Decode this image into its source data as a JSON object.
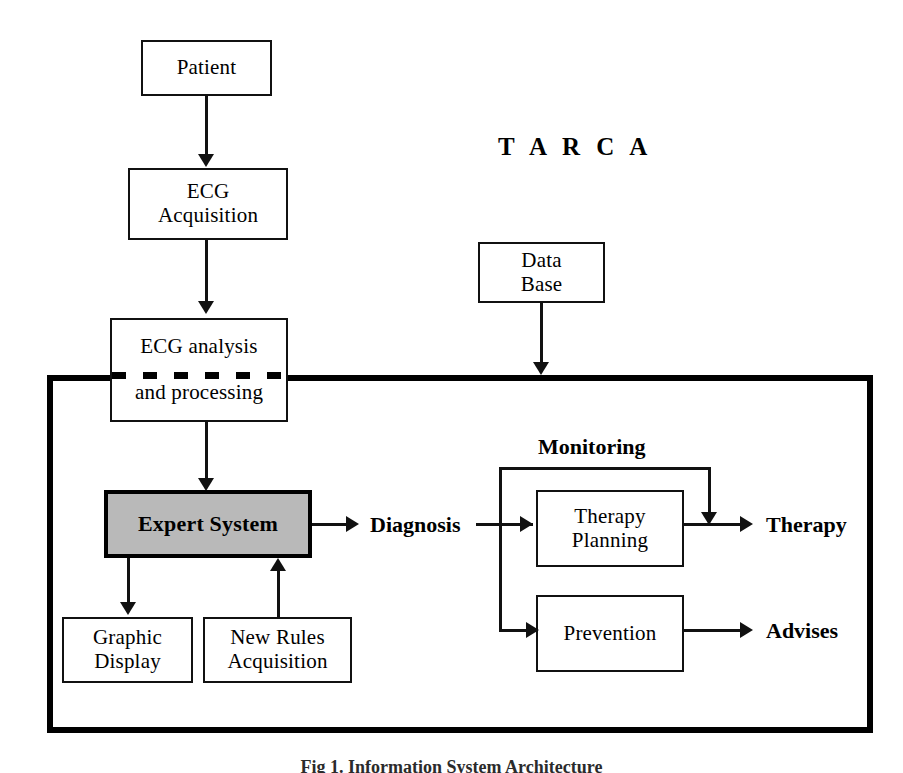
{
  "figure": {
    "title": "T A R C A",
    "caption": "Fig 1. Information System Architecture"
  },
  "boxes": {
    "patient": {
      "label": "Patient"
    },
    "ecg_acquisition": {
      "line1": "ECG",
      "line2": "Acquisition"
    },
    "ecg_analysis": {
      "line1": "ECG analysis",
      "line2": "and processing"
    },
    "data_base": {
      "line1": "Data",
      "line2": "Base"
    },
    "expert_system": {
      "label": "Expert System"
    },
    "graphic_display": {
      "line1": "Graphic",
      "line2": "Display"
    },
    "new_rules": {
      "line1": "New Rules",
      "line2": "Acquisition"
    },
    "therapy_planning": {
      "line1": "Therapy",
      "line2": "Planning"
    },
    "prevention": {
      "label": "Prevention"
    }
  },
  "labels": {
    "diagnosis": "Diagnosis",
    "monitoring": "Monitoring",
    "therapy": "Therapy",
    "advises": "Advises"
  },
  "colors": {
    "stroke": "#111111",
    "frame": "#000000",
    "expert_system_fill": "#b9b9b9",
    "background": "#ffffff"
  }
}
